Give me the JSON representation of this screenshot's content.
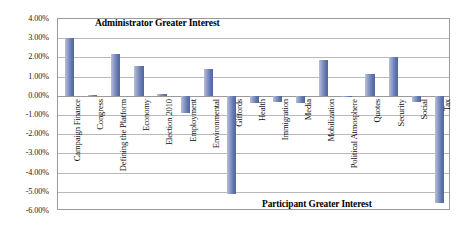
{
  "chart_data": {
    "type": "bar",
    "title": "",
    "xlabel": "",
    "ylabel": "",
    "ylim": [
      -6.0,
      4.0
    ],
    "ytick_step": 1.0,
    "grid": true,
    "legend": "none",
    "orientation": "vertical",
    "value_unit": "percent",
    "bar_color": "#5f75ae",
    "categories": [
      "Campaign Finance",
      "Congress",
      "Defining the Platform",
      "Economy",
      "Election 2010",
      "Employment",
      "Environmental",
      "Giffords",
      "Health",
      "Immigration",
      "Media",
      "Mobilization",
      "Political Atmosphere",
      "Quotes",
      "Security",
      "Social",
      "Tax"
    ],
    "values": [
      3.0,
      0.05,
      2.2,
      1.55,
      0.1,
      -0.9,
      1.4,
      -5.1,
      -0.35,
      -0.3,
      -0.4,
      1.85,
      -0.05,
      1.15,
      2.0,
      -0.3,
      -5.6
    ],
    "ytick_labels": [
      "4.00%",
      "3.00%",
      "2.00%",
      "1.00%",
      "0.00%",
      "-1.00%",
      "-2.00%",
      "-3.00%",
      "-4.00%",
      "-5.00%",
      "-6.00%"
    ],
    "ytick_values": [
      4,
      3,
      2,
      1,
      0,
      -1,
      -2,
      -3,
      -4,
      -5,
      -6
    ],
    "annotations": [
      {
        "text": "Administrator Greater Interest",
        "position": "top"
      },
      {
        "text": "Participant Greater Interest",
        "position": "bottom"
      }
    ]
  },
  "annotation_top": "Administrator Greater Interest",
  "annotation_bottom": "Participant Greater Interest"
}
